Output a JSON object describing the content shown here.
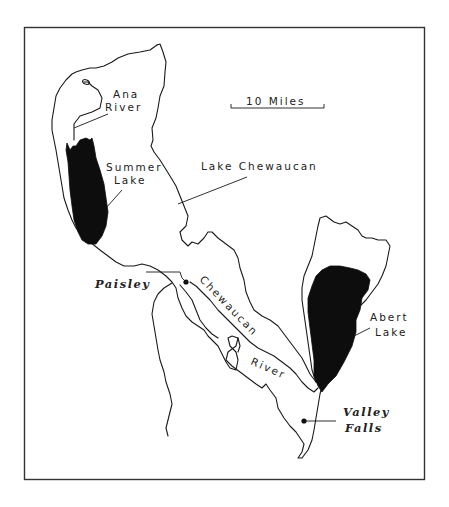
{
  "map": {
    "scale_bar": {
      "label": "10 Miles"
    },
    "labels": {
      "ana_river": [
        "Ana",
        "River"
      ],
      "summer_lake": [
        "Summer",
        "Lake"
      ],
      "lake_chewaucan": "Lake Chewaucan",
      "abert_lake": [
        "Abert",
        "Lake"
      ],
      "chewaucan_river": [
        "Chewaucan",
        "River"
      ]
    },
    "towns": [
      {
        "name": "Paisley"
      },
      {
        "name": "Valley",
        "name2": "Falls"
      }
    ],
    "colors": {
      "water": "#0d0d0d",
      "outline": "#1a1a1a",
      "background": "#ffffff"
    }
  }
}
